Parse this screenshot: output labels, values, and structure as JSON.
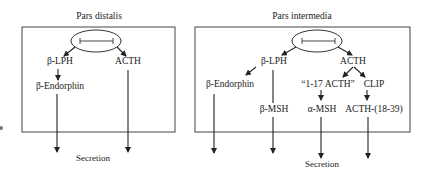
{
  "panels": {
    "left": {
      "title": "Pars distalis",
      "nodes": {
        "b_lph": "β-LPH",
        "acth": "ACTH",
        "b_endorphin": "β-Endorphin"
      },
      "output": "Secretion"
    },
    "right": {
      "title": "Pars intermedia",
      "nodes": {
        "b_lph": "β-LPH",
        "acth": "ACTH",
        "b_endorphin": "β-Endorphin",
        "acth_1_17": "“1-17 ACTH”",
        "clip": "CLIP",
        "b_msh": "β-MSH",
        "a_msh": "α-MSH",
        "acth_18_39": "ACTH-(18-39)"
      },
      "output": "Secretion"
    }
  },
  "colors": {
    "line": "#333333",
    "text": "#1a1a1a"
  }
}
